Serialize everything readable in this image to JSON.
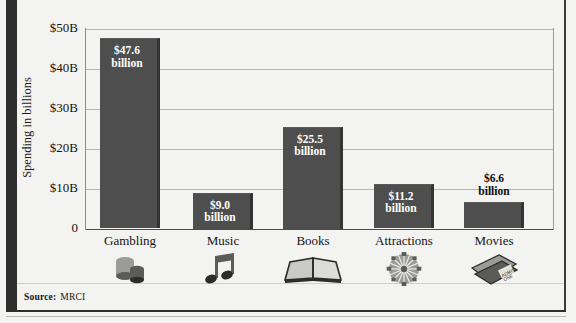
{
  "chart_data": {
    "type": "bar",
    "title": "",
    "xlabel": "",
    "ylabel": "Spending in billions",
    "ylim": [
      0,
      50
    ],
    "grid": true,
    "legend": "none",
    "categories": [
      "Gambling",
      "Music",
      "Books",
      "Attractions",
      "Movies"
    ],
    "values": [
      47.6,
      9.0,
      25.5,
      11.2,
      6.6
    ],
    "value_labels": [
      "$47.6 billion",
      "$9.0 billion",
      "$25.5 billion",
      "$11.2 billion",
      "$6.6 billion"
    ],
    "value_label_lines": [
      [
        "$47.6",
        "billion"
      ],
      [
        "$9.0",
        "billion"
      ],
      [
        "$25.5",
        "billion"
      ],
      [
        "$11.2",
        "billion"
      ],
      [
        "$6.6",
        "billion"
      ]
    ],
    "label_placement": [
      "inside",
      "inside",
      "inside",
      "inside",
      "above"
    ],
    "ytick_labels": [
      "$50B",
      "$40B",
      "$30B",
      "$20B",
      "$10B",
      "0"
    ],
    "ytick_values": [
      50,
      40,
      30,
      20,
      10,
      0
    ],
    "category_icons": [
      "poker-chips-icon",
      "music-note-icon",
      "open-book-icon",
      "ferris-wheel-icon",
      "movie-tickets-icon"
    ],
    "bar_color": "#4e4e4e",
    "background_color": "#f3f3f1",
    "gridline_color": "#b7b7b3"
  },
  "footer": {
    "source_label": "Source:",
    "source_value": "MRCI"
  }
}
